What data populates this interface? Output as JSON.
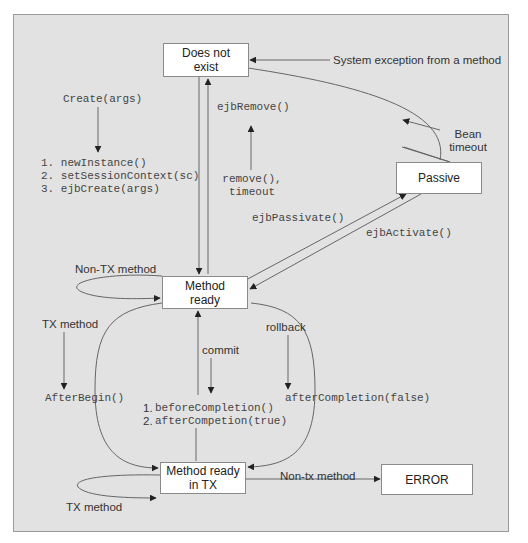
{
  "diagram": {
    "type": "state-diagram",
    "states": {
      "does_not_exist": "Does not\nexist",
      "passive": "Passive",
      "method_ready": "Method\nready",
      "method_ready_tx": "Method ready\nin TX",
      "error": "ERROR"
    },
    "labels": {
      "system_exception": "System exception from a method",
      "create_args": "Create(args)",
      "create_steps": [
        "1. newInstance()",
        "2. setSessionContext(sc)",
        "3. ejbCreate(args)"
      ],
      "ejb_remove": "ejbRemove()",
      "remove_timeout_1": "remove(),",
      "remove_timeout_2": "timeout",
      "bean_timeout_1": "Bean",
      "bean_timeout_2": "timeout",
      "ejb_passivate": "ejbPassivate()",
      "ejb_activate": "ejbActivate()",
      "non_tx_method": "Non-TX method",
      "tx_method_top": "TX method",
      "after_begin": "AfterBegin()",
      "commit": "commit",
      "rollback": "rollback",
      "after_completion_false": "afterCompletion(false)",
      "commit_steps": [
        "1.",
        "beforeCompletion()",
        "2.",
        "afterCompetion(true)"
      ],
      "non_tx_method_lower": "Non-tx method",
      "tx_method_bottom": "TX method"
    },
    "colors": {
      "background": "#e2e2e2",
      "box_fill": "#ffffff",
      "line": "#555555"
    }
  }
}
